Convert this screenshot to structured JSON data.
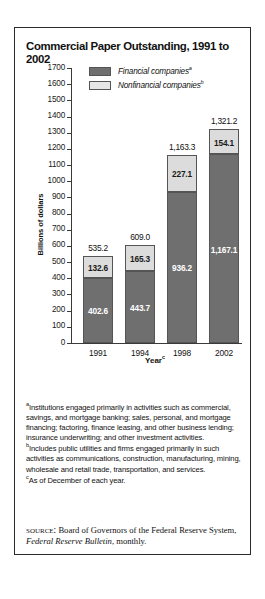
{
  "figure": {
    "title": "Commercial Paper Outstanding, 1991 to 2002"
  },
  "chart_data": {
    "type": "bar",
    "subtype": "stacked-bar",
    "title": "Commercial Paper Outstanding, 1991 to 2002",
    "xlabel": "Year",
    "xlabel_sup": "c",
    "ylabel": "Billions of dollars",
    "ylim": [
      0,
      1700
    ],
    "ytick_step": 100,
    "grid": false,
    "legend_position": "top-center",
    "categories": [
      "1991",
      "1994",
      "1998",
      "2002"
    ],
    "series": [
      {
        "name": "Financial companies",
        "name_sup": "a",
        "color": "#6f6f6f",
        "values": [
          402.6,
          443.7,
          936.2,
          1167.1
        ],
        "value_labels": [
          "402.6",
          "443.7",
          "936.2",
          "1,167.1"
        ]
      },
      {
        "name": "Nonfinancial companies",
        "name_sup": "b",
        "color": "#dcdcdc",
        "values": [
          132.6,
          165.3,
          227.1,
          154.1
        ],
        "value_labels": [
          "132.6",
          "165.3",
          "227.1",
          "154.1"
        ]
      }
    ],
    "totals": [
      535.2,
      609.0,
      1163.3,
      1321.2
    ],
    "total_labels": [
      "535.2",
      "609.0",
      "1,163.3",
      "1,321.2"
    ],
    "ytick_labels": [
      "1700",
      "1600",
      "1500",
      "1400",
      "1300",
      "1200",
      "1100",
      "1000",
      "900",
      "800",
      "700",
      "600",
      "500",
      "400",
      "300",
      "200",
      "100",
      "0"
    ]
  },
  "notes": [
    {
      "marker": "a",
      "text": "Institutions engaged primarily in activities such as commercial, savings, and mortgage banking; sales, personal, and mortgage financing; factoring, finance leasing, and other business lending; insurance underwriting; and other investment activities."
    },
    {
      "marker": "b",
      "text": "Includes public utilities and firms engaged primarily in such activities as communications, construction, manufacturing, mining, wholesale and retail trade, transportation, and services."
    },
    {
      "marker": "c",
      "text": "As of December of each year."
    }
  ],
  "source": {
    "label": "source:",
    "text_before": " Board of Governors of the Federal Reserve System, ",
    "italic": "Federal Reserve Bulletin",
    "text_after": ", monthly."
  }
}
